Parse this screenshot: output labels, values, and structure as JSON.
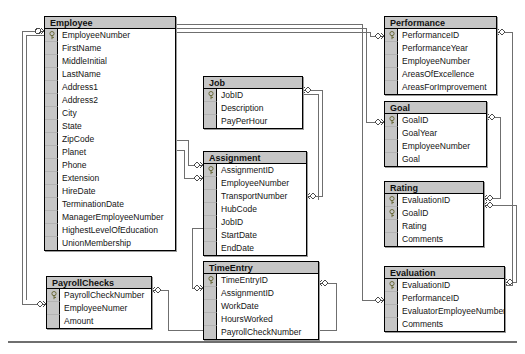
{
  "diagram": {
    "notation": "crow-foot",
    "colors": {
      "header_fill": "#c6c6c6",
      "gutter_fill": "#c6c6c6",
      "body_fill": "#ffffff",
      "border": "#000000",
      "connector": "#6f6f6f",
      "text": "#141414"
    }
  },
  "entities": [
    {
      "id": "employee",
      "name": "Employee",
      "x": 44,
      "y": 16,
      "width": 132,
      "attributes": [
        {
          "name": "EmployeeNumber",
          "key": true
        },
        {
          "name": "FirstName",
          "key": false
        },
        {
          "name": "MiddleInitial",
          "key": false
        },
        {
          "name": "LastName",
          "key": false
        },
        {
          "name": "Address1",
          "key": false
        },
        {
          "name": "Address2",
          "key": false
        },
        {
          "name": "City",
          "key": false
        },
        {
          "name": "State",
          "key": false
        },
        {
          "name": "ZipCode",
          "key": false
        },
        {
          "name": "Planet",
          "key": false
        },
        {
          "name": "Phone",
          "key": false
        },
        {
          "name": "Extension",
          "key": false
        },
        {
          "name": "HireDate",
          "key": false
        },
        {
          "name": "TerminationDate",
          "key": false
        },
        {
          "name": "ManagerEmployeeNumber",
          "key": false
        },
        {
          "name": "HighestLevelOfEducation",
          "key": false
        },
        {
          "name": "UnionMembership",
          "key": false
        }
      ]
    },
    {
      "id": "job",
      "name": "Job",
      "x": 203,
      "y": 76,
      "width": 100,
      "attributes": [
        {
          "name": "JobID",
          "key": true
        },
        {
          "name": "Description",
          "key": false
        },
        {
          "name": "PayPerHour",
          "key": false
        }
      ]
    },
    {
      "id": "assignment",
      "name": "Assignment",
      "x": 203,
      "y": 151,
      "width": 104,
      "attributes": [
        {
          "name": "AssignmentID",
          "key": true
        },
        {
          "name": "EmployeeNumber",
          "key": false
        },
        {
          "name": "TransportNumber",
          "key": false
        },
        {
          "name": "HubCode",
          "key": false
        },
        {
          "name": "JobID",
          "key": false
        },
        {
          "name": "StartDate",
          "key": false
        },
        {
          "name": "EndDate",
          "key": false
        }
      ]
    },
    {
      "id": "timeentry",
      "name": "TimeEntry",
      "x": 203,
      "y": 261,
      "width": 116,
      "attributes": [
        {
          "name": "TimeEntryID",
          "key": true
        },
        {
          "name": "AssignmentID",
          "key": false
        },
        {
          "name": "WorkDate",
          "key": false
        },
        {
          "name": "HoursWorked",
          "key": false
        },
        {
          "name": "PayrollCheckNumber",
          "key": false
        }
      ]
    },
    {
      "id": "payrollchecks",
      "name": "PayrollChecks",
      "x": 46,
      "y": 276,
      "width": 106,
      "attributes": [
        {
          "name": "PayrollCheckNumber",
          "key": true
        },
        {
          "name": "EmployeeNumer",
          "key": false
        },
        {
          "name": "Amount",
          "key": false
        }
      ]
    },
    {
      "id": "performance",
      "name": "Performance",
      "x": 384,
      "y": 16,
      "width": 113,
      "attributes": [
        {
          "name": "PerformanceID",
          "key": true
        },
        {
          "name": "PerformanceYear",
          "key": false
        },
        {
          "name": "EmployeeNumber",
          "key": false
        },
        {
          "name": "AreasOfExcellence",
          "key": false
        },
        {
          "name": "AreasForImprovement",
          "key": false
        }
      ]
    },
    {
      "id": "goal",
      "name": "Goal",
      "x": 384,
      "y": 101,
      "width": 103,
      "attributes": [
        {
          "name": "GoalID",
          "key": true
        },
        {
          "name": "GoalYear",
          "key": false
        },
        {
          "name": "EmployeeNumber",
          "key": false
        },
        {
          "name": "Goal",
          "key": false
        }
      ]
    },
    {
      "id": "rating",
      "name": "Rating",
      "x": 384,
      "y": 181,
      "width": 100,
      "attributes": [
        {
          "name": "EvaluationID",
          "key": true
        },
        {
          "name": "GoalID",
          "key": true
        },
        {
          "name": "Rating",
          "key": false
        },
        {
          "name": "Comments",
          "key": false
        }
      ]
    },
    {
      "id": "evaluation",
      "name": "Evaluation",
      "x": 384,
      "y": 266,
      "width": 121,
      "attributes": [
        {
          "name": "EvaluationID",
          "key": true
        },
        {
          "name": "PerformanceID",
          "key": false
        },
        {
          "name": "EvaluatorEmployeeNumber",
          "key": false
        },
        {
          "name": "Comments",
          "key": false
        }
      ]
    }
  ],
  "relationships": [
    {
      "from": "Employee",
      "to": "PayrollChecks",
      "label": ""
    },
    {
      "from": "Employee",
      "to": "Assignment",
      "label": ""
    },
    {
      "from": "Employee",
      "to": "Performance",
      "label": ""
    },
    {
      "from": "Employee",
      "to": "Goal",
      "label": ""
    },
    {
      "from": "Employee",
      "to": "Evaluation",
      "label": ""
    },
    {
      "from": "Job",
      "to": "Assignment",
      "label": ""
    },
    {
      "from": "Assignment",
      "to": "TimeEntry",
      "label": ""
    },
    {
      "from": "PayrollChecks",
      "to": "TimeEntry",
      "label": ""
    },
    {
      "from": "Performance",
      "to": "Evaluation",
      "label": ""
    },
    {
      "from": "Goal",
      "to": "Rating",
      "label": ""
    },
    {
      "from": "Evaluation",
      "to": "Rating",
      "label": ""
    }
  ]
}
